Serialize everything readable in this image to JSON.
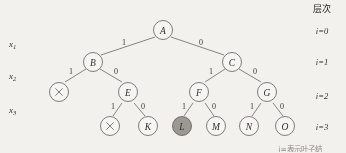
{
  "figure": {
    "title_column": "层次",
    "caption": "i=表示叶子结",
    "background_color": "#f2f1ee",
    "stroke_color": "#55514d",
    "highlight_color": "#9d9a93"
  },
  "variables": [
    {
      "name": "x-label-1",
      "base": "x",
      "sub": "1"
    },
    {
      "name": "x-label-2",
      "base": "x",
      "sub": "2"
    },
    {
      "name": "x-label-3",
      "base": "x",
      "sub": "3"
    }
  ],
  "levels": [
    {
      "label": "i=0"
    },
    {
      "label": "i=1"
    },
    {
      "label": "i=2"
    },
    {
      "label": "i=3"
    }
  ],
  "nodes": [
    {
      "id": "A",
      "label": "A",
      "level": 0,
      "highlighted": false,
      "is_cross": false
    },
    {
      "id": "B",
      "label": "B",
      "level": 1,
      "highlighted": false,
      "is_cross": false
    },
    {
      "id": "C",
      "label": "C",
      "level": 1,
      "highlighted": false,
      "is_cross": false
    },
    {
      "id": "X1",
      "label": "×",
      "level": 2,
      "highlighted": false,
      "is_cross": true
    },
    {
      "id": "E",
      "label": "E",
      "level": 2,
      "highlighted": false,
      "is_cross": false
    },
    {
      "id": "F",
      "label": "F",
      "level": 2,
      "highlighted": false,
      "is_cross": false
    },
    {
      "id": "G",
      "label": "G",
      "level": 2,
      "highlighted": false,
      "is_cross": false
    },
    {
      "id": "X2",
      "label": "×",
      "level": 3,
      "highlighted": false,
      "is_cross": true
    },
    {
      "id": "K",
      "label": "K",
      "level": 3,
      "highlighted": false,
      "is_cross": false
    },
    {
      "id": "L",
      "label": "L",
      "level": 3,
      "highlighted": true,
      "is_cross": false
    },
    {
      "id": "M",
      "label": "M",
      "level": 3,
      "highlighted": false,
      "is_cross": false
    },
    {
      "id": "N",
      "label": "N",
      "level": 3,
      "highlighted": false,
      "is_cross": false
    },
    {
      "id": "O",
      "label": "O",
      "level": 3,
      "highlighted": false,
      "is_cross": false
    }
  ],
  "edges": [
    {
      "from": "A",
      "to": "B",
      "label": "1"
    },
    {
      "from": "A",
      "to": "C",
      "label": "0"
    },
    {
      "from": "B",
      "to": "X1",
      "label": "1"
    },
    {
      "from": "B",
      "to": "E",
      "label": "0"
    },
    {
      "from": "C",
      "to": "F",
      "label": "1"
    },
    {
      "from": "C",
      "to": "G",
      "label": "0"
    },
    {
      "from": "E",
      "to": "X2",
      "label": "1"
    },
    {
      "from": "E",
      "to": "K",
      "label": "0"
    },
    {
      "from": "F",
      "to": "L",
      "label": "1"
    },
    {
      "from": "F",
      "to": "M",
      "label": "0"
    },
    {
      "from": "G",
      "to": "N",
      "label": "1"
    },
    {
      "from": "G",
      "to": "O",
      "label": "0"
    }
  ]
}
